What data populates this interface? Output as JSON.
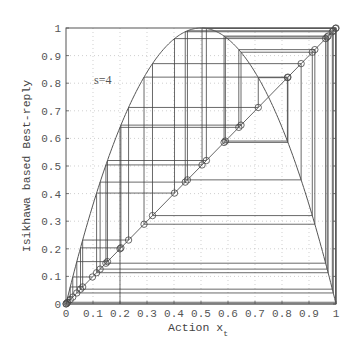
{
  "chart_data": {
    "type": "line",
    "subtype": "cobweb",
    "title": "",
    "xlabel": "Action x_t",
    "xlabel_main": "Action x",
    "xlabel_sub": "t",
    "ylabel": "Isikhawa based Best-reply",
    "annotation": "s=4",
    "xlim": [
      0,
      1
    ],
    "ylim": [
      0,
      1
    ],
    "grid": true,
    "x_ticks": [
      "0",
      "0.1",
      "0.2",
      "0.3",
      "0.4",
      "0.5",
      "0.6",
      "0.7",
      "0.8",
      "0.9",
      "1"
    ],
    "y_ticks": [
      "0",
      "0.1",
      "0.2",
      "0.3",
      "0.4",
      "0.5",
      "0.6",
      "0.7",
      "0.8",
      "0.9",
      "1"
    ],
    "series": [
      {
        "name": "best-reply curve",
        "function": "s*x*(1-x)",
        "s": 4
      },
      {
        "name": "45-degree line",
        "function": "x"
      },
      {
        "name": "cobweb trajectory",
        "x0": 0.2,
        "iterations": 40,
        "marker": "circle on diagonal"
      }
    ],
    "colors": {
      "curve": "#555555",
      "diagonal": "#666666",
      "cobweb": "#444444",
      "grid": "#bbbbbb",
      "axes": "#555555"
    }
  }
}
